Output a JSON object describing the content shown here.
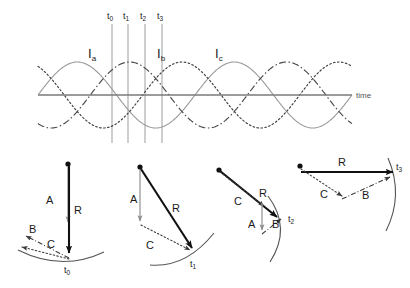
{
  "figure": {
    "colors": {
      "wave": "#8c8c8c",
      "axis": "#6e6e6e",
      "gridline": "#a0a0a0",
      "vector_main": "#111111",
      "vector_light": "#9a9a9a",
      "arc": "#555555",
      "text": "#1a1a1a"
    }
  },
  "waveform": {
    "time_axis_label": "time",
    "time_markers": [
      {
        "id": "t0",
        "letter": "t",
        "sub": "0",
        "x": 112
      },
      {
        "id": "t1",
        "letter": "t",
        "sub": "1",
        "x": 128
      },
      {
        "id": "t2",
        "letter": "t",
        "sub": "2",
        "x": 145
      },
      {
        "id": "t3",
        "letter": "t",
        "sub": "3",
        "x": 162
      }
    ],
    "phases": [
      {
        "id": "Ia",
        "letter": "I",
        "sub": "a",
        "style": "solid",
        "phase_deg": 0,
        "label_x": 88,
        "label_y": 55
      },
      {
        "id": "Ib",
        "letter": "I",
        "sub": "b",
        "style": "dashdot",
        "phase_deg": -120,
        "label_x": 157,
        "label_y": 55
      },
      {
        "id": "Ic",
        "letter": "I",
        "sub": "c",
        "style": "dotted",
        "phase_deg": -240,
        "label_x": 215,
        "label_y": 55
      }
    ]
  },
  "chart_data": {
    "type": "line",
    "xlabel": "time",
    "ylabel": "",
    "grid": false,
    "legend_position": "inline-labels",
    "axis": {
      "x_start": 38,
      "x_end": 352,
      "y_zero": 95,
      "amplitude": 33
    },
    "x_range_cycles": [
      0,
      2
    ],
    "series": [
      {
        "name": "Ia",
        "style": "solid",
        "phase_deg": 0,
        "amplitude": 1.0
      },
      {
        "name": "Ib",
        "style": "dashdot",
        "phase_deg": -120,
        "amplitude": 1.0
      },
      {
        "name": "Ic",
        "style": "dotted",
        "phase_deg": -240,
        "amplitude": 1.0
      }
    ],
    "sample_points": {
      "t0": {
        "Ia": 1.0,
        "Ib": -0.5,
        "Ic": -0.5
      },
      "t1": {
        "Ia": 0.5,
        "Ib": 0.5,
        "Ic": -1.0
      },
      "t2": {
        "Ia": -0.5,
        "Ib": 1.0,
        "Ic": -0.5
      },
      "t3": {
        "Ia": -1.0,
        "Ib": 0.5,
        "Ic": 0.5
      }
    }
  },
  "vector_panels": [
    {
      "id": "panel-t0",
      "time_label": {
        "letter": "t",
        "sub": "0"
      },
      "vectors": [
        {
          "name": "A",
          "label": "A",
          "style": "light",
          "label_x": 46,
          "label_y": 204
        },
        {
          "name": "R",
          "label": "R",
          "style": "bold",
          "label_x": 70,
          "label_y": 214
        },
        {
          "name": "B",
          "label": "B",
          "style": "dashdot",
          "label_x": 31,
          "label_y": 233
        },
        {
          "name": "C",
          "label": "C",
          "style": "dotted",
          "label_x": 47,
          "label_y": 247
        }
      ]
    },
    {
      "id": "panel-t1",
      "time_label": {
        "letter": "t",
        "sub": "1"
      },
      "vectors": [
        {
          "name": "A",
          "label": "A",
          "style": "light",
          "label_x": 134,
          "label_y": 203
        },
        {
          "name": "R",
          "label": "R",
          "style": "bold",
          "label_x": 176,
          "label_y": 212
        },
        {
          "name": "C",
          "label": "C",
          "style": "dotted",
          "label_x": 148,
          "label_y": 249
        }
      ]
    },
    {
      "id": "panel-t2",
      "time_label": {
        "letter": "t",
        "sub": "2"
      },
      "vectors": [
        {
          "name": "R",
          "label": "R",
          "style": "bold",
          "label_x": 262,
          "label_y": 196
        },
        {
          "name": "C",
          "label": "C",
          "style": "dotted",
          "label_x": 238,
          "label_y": 205
        },
        {
          "name": "A",
          "label": "A",
          "style": "light",
          "label_x": 252,
          "label_y": 227
        },
        {
          "name": "B",
          "label": "B",
          "style": "dashdot",
          "label_x": 277,
          "label_y": 227
        }
      ]
    },
    {
      "id": "panel-t3",
      "time_label": {
        "letter": "t",
        "sub": "3"
      },
      "vectors": [
        {
          "name": "R",
          "label": "R",
          "style": "bold",
          "label_x": 342,
          "label_y": 166
        },
        {
          "name": "C",
          "label": "C",
          "style": "dotted",
          "label_x": 322,
          "label_y": 197
        },
        {
          "name": "B",
          "label": "B",
          "style": "dashdot",
          "label_x": 364,
          "label_y": 198
        }
      ]
    }
  ]
}
